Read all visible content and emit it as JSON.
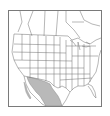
{
  "map": {
    "type": "range-map",
    "region": "North America",
    "frame": {
      "x": 8,
      "y": 10,
      "width": 94,
      "height": 97
    },
    "colors": {
      "background": "#ffffff",
      "land_fill": "#ffffff",
      "borders": "#6e6e6e",
      "frame": "#7a7a7a",
      "range_fill": "#b9b9b9"
    },
    "layers": [
      {
        "name": "canada-provinces",
        "shaded": false
      },
      {
        "name": "us-states",
        "shaded": false
      },
      {
        "name": "mexico",
        "shaded": false
      },
      {
        "name": "species-range",
        "shaded": true,
        "area": "northwestern Mexico and US–Mexico border region (Sonora, Chihuahua, Sinaloa, southern Arizona/New Mexico)"
      }
    ]
  }
}
